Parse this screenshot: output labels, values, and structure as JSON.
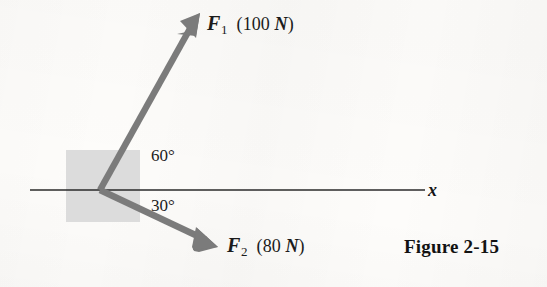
{
  "figure": {
    "caption": "Figure 2-15",
    "axis_label_x": "x",
    "background_color": "#fdfcfa",
    "vector_color": "#7b7b7b",
    "block_color": "#dcdcdc",
    "axis_color": "#2a2a2a",
    "text_color": "#1b1b1b"
  },
  "forces": [
    {
      "symbol": "F",
      "subscript": "1",
      "magnitude": "100",
      "unit": "N",
      "magnitude_text": "(100 N)",
      "angle_label": "60°",
      "angle_degrees": 60,
      "direction": "above x-axis, up and to the right"
    },
    {
      "symbol": "F",
      "subscript": "2",
      "magnitude": "80",
      "unit": "N",
      "magnitude_text": "(80 N)",
      "angle_label": "30°",
      "angle_degrees": 30,
      "direction": "below x-axis, down and to the right"
    }
  ],
  "annotations": {
    "angle_60": "60°",
    "angle_30": "30°"
  },
  "geometry": {
    "origin_x": 100,
    "origin_y": 190,
    "axis_start_x": 30,
    "axis_end_x": 425,
    "block_left": 66,
    "block_top": 150,
    "block_size": 74,
    "f1_tip_x": 200,
    "f1_tip_y": 13,
    "f2_tip_x": 218,
    "f2_tip_y": 247
  }
}
